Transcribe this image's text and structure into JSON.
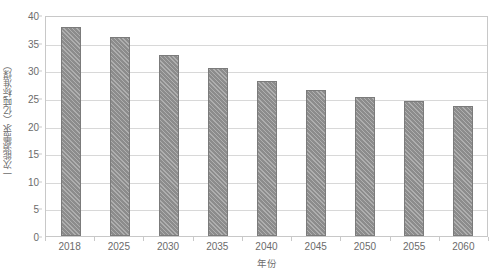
{
  "chart_data": {
    "type": "bar",
    "title": "",
    "subtitle": "",
    "xlabel": "年份",
    "ylabel": "一次能源需求（亿吨标准煤）",
    "categories": [
      "2018",
      "2025",
      "2030",
      "2035",
      "2040",
      "2045",
      "2050",
      "2055",
      "2060"
    ],
    "values": [
      37.8,
      36.1,
      32.8,
      30.5,
      28.0,
      26.5,
      25.1,
      24.5,
      23.6
    ],
    "series": [
      {
        "name": "一次能源需求",
        "values": [
          37.8,
          36.1,
          32.8,
          30.5,
          28.0,
          26.5,
          25.1,
          24.5,
          23.6
        ]
      }
    ],
    "ylim": [
      0,
      40
    ],
    "ytick_labels": [
      "0",
      "5",
      "10",
      "15",
      "20",
      "25",
      "30",
      "35",
      "40"
    ],
    "ytick_values": [
      0,
      5,
      10,
      15,
      20,
      25,
      30,
      35,
      40
    ],
    "grid": true,
    "grid_axis": "y",
    "legend": false,
    "legend_position": "none",
    "bar_color": "#8c8c8c",
    "bar_edge_color": "#7b7b7b",
    "bar_pattern": "diagonal-hatch",
    "grid_color": "#d8d8d8",
    "axis_color": "#c8c8c8",
    "text_color": "#6b6b6b",
    "background_color": "#ffffff"
  }
}
